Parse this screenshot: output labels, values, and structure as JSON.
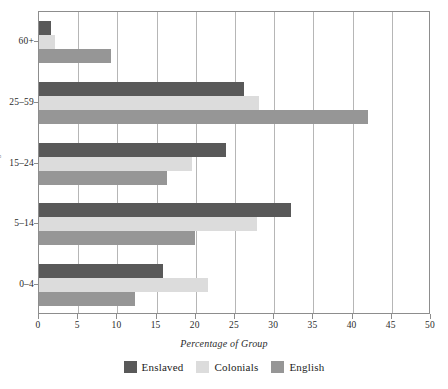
{
  "chart_data": {
    "type": "bar",
    "orientation": "horizontal",
    "title": "",
    "subtitle": "",
    "xlabel": "Percentage of Group",
    "ylabel": "Age",
    "categories": [
      "0–4",
      "5–14",
      "15–24",
      "25–59",
      "60+"
    ],
    "category_order_top_to_bottom": [
      "60+",
      "25–59",
      "15–24",
      "5–14",
      "0–4"
    ],
    "series": [
      {
        "name": "Enslaved",
        "color": "#595959",
        "values": [
          15.8,
          32.2,
          23.8,
          26.2,
          1.5
        ]
      },
      {
        "name": "Colonials",
        "color": "#dcdcdc",
        "values": [
          21.5,
          27.8,
          19.5,
          28.0,
          2.0
        ]
      },
      {
        "name": "English",
        "color": "#969696",
        "values": [
          12.3,
          19.9,
          16.3,
          42.0,
          9.2
        ]
      }
    ],
    "xlim": [
      0,
      50
    ],
    "xticks": [
      0,
      5,
      10,
      15,
      20,
      25,
      30,
      35,
      40,
      45,
      50
    ],
    "xtick_labels": [
      "0",
      "5",
      "10",
      "15",
      "20",
      "25",
      "30",
      "35",
      "40",
      "45",
      "50"
    ],
    "grid": "vertical",
    "legend_position": "bottom",
    "legend_entries": [
      "Enslaved",
      "Colonials",
      "English"
    ]
  },
  "axis": {
    "x_title": "Percentage of Group",
    "y_title": "Age"
  },
  "legend": {
    "items": [
      {
        "label": "Enslaved",
        "color": "#595959"
      },
      {
        "label": "Colonials",
        "color": "#dcdcdc"
      },
      {
        "label": "English",
        "color": "#969696"
      }
    ]
  },
  "colors": {
    "enslaved": "#595959",
    "colonials": "#dcdcdc",
    "english": "#969696",
    "gridline": "#b6b6b6",
    "frame": "#8d8d8d",
    "text": "#2b2b2b",
    "background": "#ffffff"
  }
}
